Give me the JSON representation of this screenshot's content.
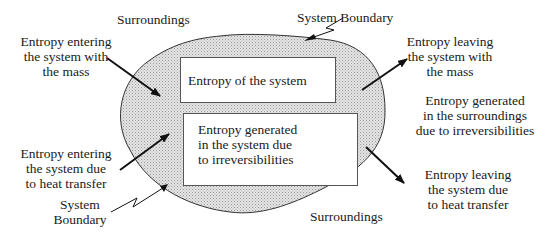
{
  "labels": {
    "surroundings_top": "Surroundings",
    "system_boundary_top": "System Boundary",
    "entering_mass": "Entropy entering\nthe system with\nthe mass",
    "leaving_mass": "Entropy  leaving\nthe system with\nthe mass",
    "generated_surroundings": "Entropy generated\nin the surroundings\ndue to irreversibilities",
    "entering_heat": "Entropy entering\nthe system due\nto heat transfer",
    "system_boundary_bottom": "System\nBoundary",
    "surroundings_bottom": "Surroundings",
    "leaving_heat": "Entropy leaving\nthe system due\nto heat transfer"
  },
  "boxes": {
    "system_entropy": "Entropy of the system",
    "generated_system": "Entropy generated\nin the system due\nto irreversibilities"
  },
  "colors": {
    "boundary_fill": "#d9d9d9",
    "stroke": "#222222",
    "box_border": "#555555"
  }
}
